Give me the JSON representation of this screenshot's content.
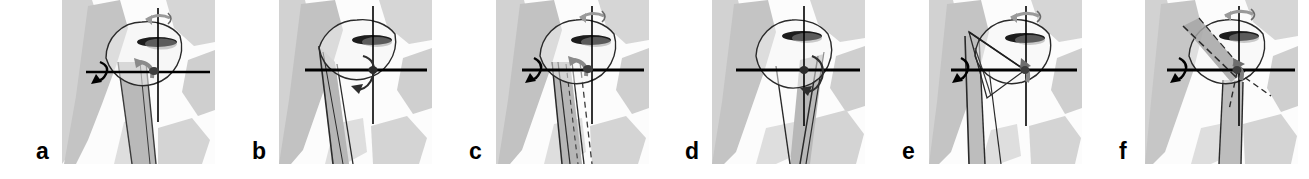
{
  "figure": {
    "caption_present": false,
    "panel_count": 6,
    "background_color": "#ffffff",
    "outline_color": "#1a1a1a",
    "axis_color": "#000000",
    "bone_light_color": "#d8d8d8",
    "bone_mid_color": "#bdbdbd",
    "bone_dark_color": "#a8a8a8",
    "glenoid_color": "#1a1a1a",
    "arrow_gray_color": "#8c8c8c"
  },
  "panels": [
    {
      "label": "a",
      "label_x": 36,
      "panel_x": 62,
      "panel_width": 153,
      "icon": "shoulder-rotation-diagram",
      "vertical_axis": true,
      "horizontal_axis": true,
      "vertical_spin_arrow": true,
      "horizontal_spin_arrow": true,
      "center_arrow": "gray-curved",
      "humeral_shaft": "wide-shaded",
      "dashed_overlay": false,
      "wedge_overlay": false,
      "mirrored": false
    },
    {
      "label": "b",
      "label_x": 252,
      "panel_x": 279,
      "panel_width": 153,
      "icon": "shoulder-rotation-diagram",
      "vertical_axis": true,
      "horizontal_axis": true,
      "vertical_spin_arrow": false,
      "horizontal_spin_arrow": false,
      "center_arrow": "black-curved",
      "humeral_shaft": "narrow-outline",
      "dashed_overlay": false,
      "wedge_overlay": false,
      "mirrored": false
    },
    {
      "label": "c",
      "label_x": 469,
      "panel_x": 496,
      "panel_width": 153,
      "icon": "shoulder-rotation-diagram",
      "vertical_axis": true,
      "horizontal_axis": true,
      "vertical_spin_arrow": true,
      "horizontal_spin_arrow": true,
      "center_arrow": "gray-curved",
      "humeral_shaft": "double-outline",
      "dashed_overlay": true,
      "wedge_overlay": false,
      "mirrored": false
    },
    {
      "label": "d",
      "label_x": 685,
      "panel_x": 712,
      "panel_width": 153,
      "icon": "shoulder-rotation-diagram",
      "vertical_axis": true,
      "horizontal_axis": true,
      "vertical_spin_arrow": false,
      "horizontal_spin_arrow": false,
      "center_arrow": "black-curved",
      "humeral_shaft": "right-leaning",
      "dashed_overlay": false,
      "wedge_overlay": false,
      "mirrored": false
    },
    {
      "label": "e",
      "label_x": 902,
      "panel_x": 929,
      "panel_width": 153,
      "icon": "shoulder-rotation-diagram",
      "vertical_axis": true,
      "horizontal_axis": true,
      "vertical_spin_arrow": true,
      "horizontal_spin_arrow": true,
      "center_arrow": "gray-curved",
      "humeral_shaft": "narrow-vertical",
      "dashed_overlay": false,
      "wedge_overlay": "upper-left-angle",
      "mirrored": false
    },
    {
      "label": "f",
      "label_x": 1119,
      "panel_x": 1145,
      "panel_width": 153,
      "icon": "shoulder-rotation-diagram",
      "vertical_axis": true,
      "horizontal_axis": true,
      "vertical_spin_arrow": true,
      "horizontal_spin_arrow": true,
      "center_arrow": "gray-curved",
      "humeral_shaft": "narrow-outline",
      "dashed_overlay": true,
      "wedge_overlay": "diagonal-band",
      "mirrored": false
    }
  ]
}
